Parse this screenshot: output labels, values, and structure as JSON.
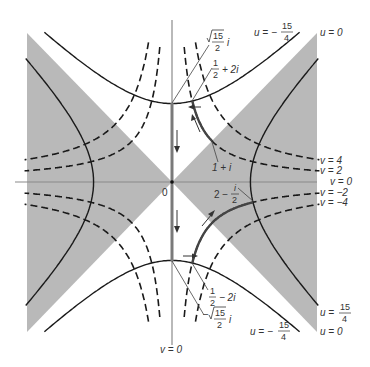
{
  "diagram": {
    "type": "level-curves",
    "colors": {
      "shade": "#b9b9b9",
      "axis": "#8a8a8a",
      "curve": "#1a1a1a",
      "contour": "#7a7a7a",
      "background": "#ffffff",
      "text": "#333333"
    },
    "origin_label": "0",
    "origin_px": [
      172,
      182
    ],
    "scale_px_per_unit": 40.5,
    "extent_units": 3.65,
    "solid_curves": [
      {
        "name": "u = 15/4",
        "eq": "x^2 - y^2 = 3.75"
      },
      {
        "name": "u = -15/4",
        "eq": "y^2 - x^2 = 3.75"
      },
      {
        "name": "u = 0",
        "eq": "y = ±x"
      }
    ],
    "dashed_curves": [
      {
        "name": "v = 4",
        "eq": "xy = 2"
      },
      {
        "name": "v = 2",
        "eq": "xy = 1"
      },
      {
        "name": "v = -2",
        "eq": "xy = -1"
      },
      {
        "name": "v = -4",
        "eq": "xy = -2"
      },
      {
        "name": "v = 0",
        "eq": "x = 0 or y = 0"
      }
    ],
    "points": [
      {
        "label": "√(15)/2 i",
        "x": 0,
        "y": 1.936
      },
      {
        "label": "1/2 + 2i",
        "x": 0.5,
        "y": 2
      },
      {
        "label": "1 + i",
        "x": 1,
        "y": 1
      },
      {
        "label": "2 − i/2",
        "x": 2,
        "y": -0.5
      },
      {
        "label": "1/2 − 2i",
        "x": 0.5,
        "y": -2
      },
      {
        "label": "−√(15)/2 i",
        "x": 0,
        "y": -1.936
      }
    ],
    "labels": {
      "u_neg_top": {
        "lhs": "u = −",
        "num": "15",
        "den": "4"
      },
      "u_zero_top": "u = 0",
      "v4": "v = 4",
      "v2": "v = 2",
      "v0_right": "v = 0",
      "vm2": "v = −2",
      "vm4": "v = −4",
      "u_pos_bottom": {
        "lhs": "u =",
        "num": "15",
        "den": "4"
      },
      "u_neg_bottom": {
        "lhs": "u = −",
        "num": "15",
        "den": "4"
      },
      "u_zero_bottom": "u = 0",
      "v0_bottom": "v = 0",
      "sqrt15_top": {
        "prefix": "",
        "num": "15",
        "den": "2",
        "suffix": "i"
      },
      "half_plus_2i": {
        "num": "1",
        "den": "2",
        "suffix": "+ 2i"
      },
      "one_plus_i": "1 + i",
      "two_minus_i2": {
        "lhs": "2 −",
        "num": "i",
        "den": "2"
      },
      "half_minus_2i": {
        "num": "1",
        "den": "2",
        "suffix": "− 2i"
      },
      "sqrt15_bottom": {
        "prefix": "−",
        "num": "15",
        "den": "2",
        "suffix": "i"
      }
    }
  }
}
